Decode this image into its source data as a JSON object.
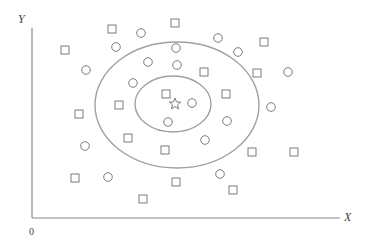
{
  "diagram": {
    "axes": {
      "y_label": "Y",
      "x_label": "X",
      "origin_label": "0"
    },
    "colors": {
      "line": "#8a8a8a",
      "ellipse": "#a0a0a0",
      "marker": "#6e6e6e"
    },
    "ellipses": [
      {
        "name": "outer",
        "cx": 177,
        "cy": 105,
        "rx": 82,
        "ry": 63
      },
      {
        "name": "inner",
        "cx": 173,
        "cy": 104,
        "rx": 38,
        "ry": 28
      }
    ],
    "star": {
      "x": 175,
      "y": 104
    },
    "squares": [
      [
        65,
        50
      ],
      [
        112,
        29
      ],
      [
        175,
        23
      ],
      [
        264,
        42
      ],
      [
        257,
        73
      ],
      [
        204,
        72
      ],
      [
        79,
        114
      ],
      [
        119,
        105
      ],
      [
        166,
        94
      ],
      [
        226,
        94
      ],
      [
        128,
        138
      ],
      [
        165,
        150
      ],
      [
        252,
        152
      ],
      [
        294,
        152
      ],
      [
        75,
        178
      ],
      [
        176,
        182
      ],
      [
        233,
        190
      ],
      [
        143,
        199
      ]
    ],
    "circles": [
      [
        141,
        33
      ],
      [
        116,
        47
      ],
      [
        176,
        48
      ],
      [
        218,
        38
      ],
      [
        238,
        52
      ],
      [
        148,
        62
      ],
      [
        177,
        65
      ],
      [
        288,
        72
      ],
      [
        86,
        70
      ],
      [
        133,
        83
      ],
      [
        192,
        103
      ],
      [
        168,
        122
      ],
      [
        227,
        121
      ],
      [
        271,
        107
      ],
      [
        85,
        146
      ],
      [
        205,
        140
      ],
      [
        108,
        177
      ],
      [
        220,
        174
      ]
    ]
  }
}
